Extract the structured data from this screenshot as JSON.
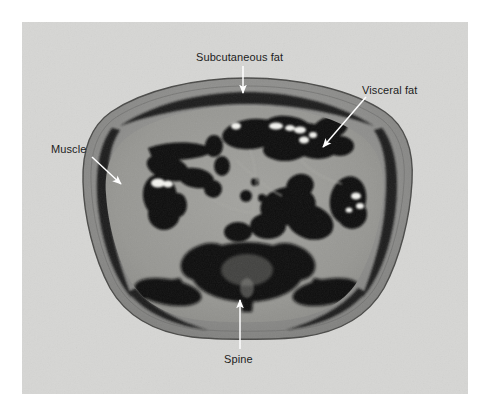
{
  "figure": {
    "kind": "axial-abdominal-ct-scan",
    "page_background": "#ffffff",
    "panel_background": "#d6d6d4",
    "annotation_color": "#ffffff",
    "label_text_color": "#1d1d1d"
  },
  "annotations": [
    {
      "id": "subcutaneous-fat",
      "label": "Subcutaneous fat",
      "arrow": "vertical-down",
      "label_position": {
        "x": 196,
        "y": 51
      },
      "arrow_start": {
        "x": 243,
        "y": 66
      },
      "arrow_tip": {
        "x": 243,
        "y": 95
      }
    },
    {
      "id": "visceral-fat",
      "label": "Visceral fat",
      "arrow": "diagonal-down-left",
      "label_position": {
        "x": 362,
        "y": 84
      },
      "arrow_start": {
        "x": 366,
        "y": 97
      },
      "arrow_tip": {
        "x": 321,
        "y": 149
      }
    },
    {
      "id": "muscle",
      "label": "Muscle",
      "arrow": "diagonal-down-right",
      "label_position": {
        "x": 51,
        "y": 143
      },
      "arrow_start": {
        "x": 92,
        "y": 157
      },
      "arrow_tip": {
        "x": 123,
        "y": 186
      }
    },
    {
      "id": "spine",
      "label": "Spine",
      "arrow": "vertical-up",
      "label_position": {
        "x": 224,
        "y": 353
      },
      "arrow_start": {
        "x": 240,
        "y": 349
      },
      "arrow_tip": {
        "x": 240,
        "y": 298
      }
    }
  ],
  "scan": {
    "body_bounds": {
      "left": 83,
      "top": 78,
      "right": 412,
      "bottom": 337
    },
    "tissue_colors": {
      "subcutaneous_fat": "#8f8f8d",
      "muscle_band": "#232323",
      "visceral_fat": "#9b9b97",
      "bowel_gas": "#0b0b0b",
      "contrast_material": "#f2f2ee",
      "bone": "#141414",
      "skin_line": "#3a3a3a"
    }
  }
}
